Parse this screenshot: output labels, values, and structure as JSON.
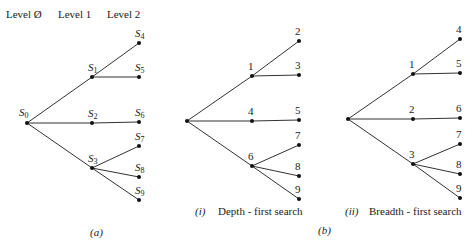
{
  "levels": [
    "Level Ø",
    "Level 1",
    "Level 2"
  ],
  "trees": [
    {
      "id": "a",
      "caption": "(a)",
      "nodes": [
        {
          "id": "r",
          "label": "S",
          "sub": "0",
          "level": 0,
          "slot": 0
        },
        {
          "id": "a",
          "label": "S",
          "sub": "1",
          "level": 1,
          "slot": 0
        },
        {
          "id": "b",
          "label": "S",
          "sub": "2",
          "level": 1,
          "slot": 1
        },
        {
          "id": "c",
          "label": "S",
          "sub": "3",
          "level": 1,
          "slot": 2
        },
        {
          "id": "d",
          "label": "S",
          "sub": "4",
          "level": 2,
          "slot": 0
        },
        {
          "id": "e",
          "label": "S",
          "sub": "5",
          "level": 2,
          "slot": 1
        },
        {
          "id": "f",
          "label": "S",
          "sub": "6",
          "level": 2,
          "slot": 2
        },
        {
          "id": "g",
          "label": "S",
          "sub": "7",
          "level": 2,
          "slot": 3
        },
        {
          "id": "h",
          "label": "S",
          "sub": "8",
          "level": 2,
          "slot": 4
        },
        {
          "id": "i",
          "label": "S",
          "sub": "9",
          "level": 2,
          "slot": 5
        }
      ]
    },
    {
      "id": "b-i",
      "caption_prefix": "(i)",
      "caption": "Depth - first search",
      "nodes": [
        {
          "id": "r",
          "label": "",
          "level": 0,
          "slot": 0
        },
        {
          "id": "a",
          "label": "1",
          "level": 1,
          "slot": 0
        },
        {
          "id": "b",
          "label": "4",
          "level": 1,
          "slot": 1
        },
        {
          "id": "c",
          "label": "6",
          "level": 1,
          "slot": 2
        },
        {
          "id": "d",
          "label": "2",
          "level": 2,
          "slot": 0
        },
        {
          "id": "e",
          "label": "3",
          "level": 2,
          "slot": 1
        },
        {
          "id": "f",
          "label": "5",
          "level": 2,
          "slot": 2
        },
        {
          "id": "g",
          "label": "7",
          "level": 2,
          "slot": 3
        },
        {
          "id": "h",
          "label": "8",
          "level": 2,
          "slot": 4
        },
        {
          "id": "i",
          "label": "9",
          "level": 2,
          "slot": 5
        }
      ]
    },
    {
      "id": "b-ii",
      "caption_prefix": "(ii)",
      "caption": "Breadth - first search",
      "nodes": [
        {
          "id": "r",
          "label": "",
          "level": 0,
          "slot": 0
        },
        {
          "id": "a",
          "label": "1",
          "level": 1,
          "slot": 0
        },
        {
          "id": "b",
          "label": "2",
          "level": 1,
          "slot": 1
        },
        {
          "id": "c",
          "label": "3",
          "level": 1,
          "slot": 2
        },
        {
          "id": "d",
          "label": "4",
          "level": 2,
          "slot": 0
        },
        {
          "id": "e",
          "label": "5",
          "level": 2,
          "slot": 1
        },
        {
          "id": "f",
          "label": "6",
          "level": 2,
          "slot": 2
        },
        {
          "id": "g",
          "label": "7",
          "level": 2,
          "slot": 3
        },
        {
          "id": "h",
          "label": "8",
          "level": 2,
          "slot": 4
        },
        {
          "id": "i",
          "label": "9",
          "level": 2,
          "slot": 5
        }
      ]
    }
  ],
  "edges": [
    [
      "r",
      "a"
    ],
    [
      "r",
      "b"
    ],
    [
      "r",
      "c"
    ],
    [
      "a",
      "d"
    ],
    [
      "a",
      "e"
    ],
    [
      "b",
      "f"
    ],
    [
      "c",
      "g"
    ],
    [
      "c",
      "h"
    ],
    [
      "c",
      "i"
    ]
  ],
  "group_caption": "(b)"
}
